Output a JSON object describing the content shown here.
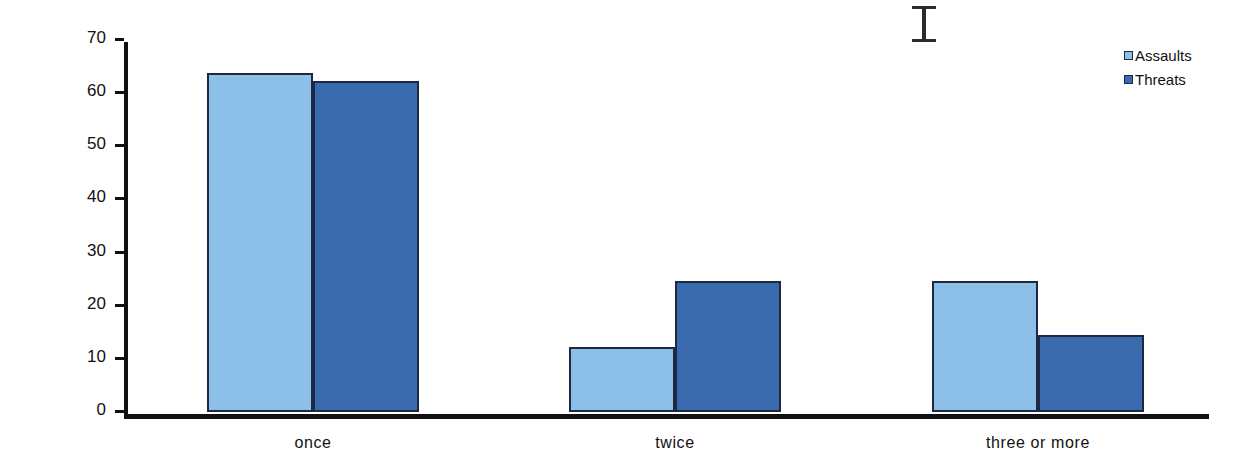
{
  "chart_data": {
    "type": "bar",
    "title": "",
    "xlabel": "",
    "ylabel": "Percentage",
    "categories": [
      "once",
      "twice",
      "three or more"
    ],
    "series": [
      {
        "name": "Assaults",
        "color": "#8cc0e8",
        "values": [
          63.7,
          12.3,
          24.6
        ]
      },
      {
        "name": "Threats",
        "color": "#3a6aae",
        "values": [
          62.2,
          24.6,
          14.5
        ]
      }
    ],
    "ylim": [
      0,
      70
    ],
    "yticks": [
      0,
      10,
      20,
      30,
      40,
      50,
      60,
      70
    ],
    "ytick_labels": [
      "0",
      "10",
      "20",
      "30",
      "40",
      "50",
      "60",
      "70"
    ],
    "grid": false,
    "legend_position": "top-right",
    "axis_color": "#111111",
    "bar_border_color": "#1b2a40"
  },
  "legend": {
    "items": [
      {
        "label": "Assaults"
      },
      {
        "label": "Threats"
      }
    ]
  },
  "artifacts": {
    "text_cursor": "I-beam"
  }
}
